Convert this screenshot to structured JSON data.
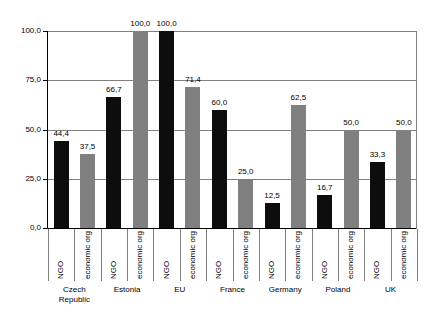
{
  "chart_data": {
    "type": "bar",
    "title": "",
    "subtitle": "",
    "xlabel": "",
    "ylabel": "",
    "ylim": [
      0,
      100
    ],
    "y_ticks": [
      "0,0",
      "25,0",
      "50,0",
      "75,0",
      "100,0"
    ],
    "y_tick_values": [
      0,
      25,
      50,
      75,
      100
    ],
    "grid": true,
    "legend_position": "none",
    "decimal_separator": ",",
    "categories": [
      "Czech\nRepublic",
      "Estonia",
      "EU",
      "France",
      "Germany",
      "Poland",
      "UK"
    ],
    "series": [
      {
        "name": "NGO",
        "color": "#0d0d0d",
        "values": [
          44.4,
          66.7,
          100.0,
          60.0,
          12.5,
          16.7,
          33.3
        ],
        "labels": [
          "44,4",
          "66,7",
          "100,0",
          "60,0",
          "12,5",
          "16,7",
          "33,3"
        ]
      },
      {
        "name": "economic org",
        "color": "#808080",
        "values": [
          37.5,
          100.0,
          71.4,
          25.0,
          62.5,
          50.0,
          50.0
        ],
        "labels": [
          "37,5",
          "100,0",
          "71,4",
          "25,0",
          "62,5",
          "50,0",
          "50,0"
        ]
      }
    ],
    "bars": [
      {
        "country": "Czech\nRepublic",
        "series": "NGO",
        "value": 44.4,
        "label": "44,4"
      },
      {
        "country": "Czech\nRepublic",
        "series": "economic org",
        "value": 37.5,
        "label": "37,5"
      },
      {
        "country": "Estonia",
        "series": "NGO",
        "value": 66.7,
        "label": "66,7"
      },
      {
        "country": "Estonia",
        "series": "economic org",
        "value": 100.0,
        "label": "100,0"
      },
      {
        "country": "EU",
        "series": "NGO",
        "value": 100.0,
        "label": "100,0"
      },
      {
        "country": "EU",
        "series": "economic org",
        "value": 71.4,
        "label": "71,4"
      },
      {
        "country": "France",
        "series": "NGO",
        "value": 60.0,
        "label": "60,0"
      },
      {
        "country": "France",
        "series": "economic org",
        "value": 25.0,
        "label": "25,0"
      },
      {
        "country": "Germany",
        "series": "NGO",
        "value": 12.5,
        "label": "12,5"
      },
      {
        "country": "Germany",
        "series": "economic org",
        "value": 62.5,
        "label": "62,5"
      },
      {
        "country": "Poland",
        "series": "NGO",
        "value": 16.7,
        "label": "16,7"
      },
      {
        "country": "Poland",
        "series": "economic org",
        "value": 50.0,
        "label": "50,0"
      },
      {
        "country": "UK",
        "series": "NGO",
        "value": 33.3,
        "label": "33,3"
      },
      {
        "country": "UK",
        "series": "economic org",
        "value": 50.0,
        "label": "50,0"
      }
    ],
    "colors": {
      "ngo": "#0d0d0d",
      "economic_org": "#808080",
      "axis": "#000000",
      "gridline": "#808080",
      "background": "#ffffff"
    }
  }
}
